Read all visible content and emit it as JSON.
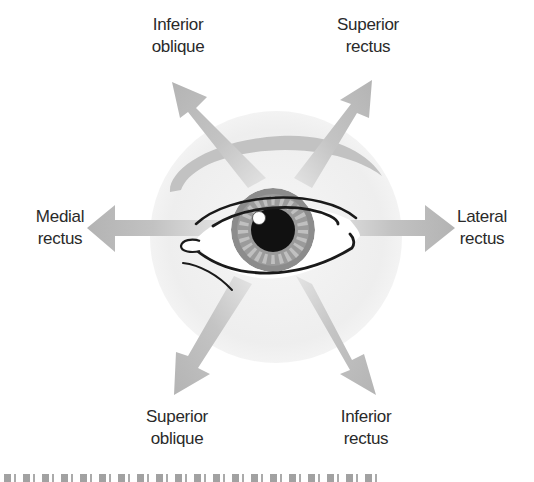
{
  "figure": {
    "type": "anatomical-diagram",
    "colors": {
      "background": "#ffffff",
      "face_circle": "#efefef",
      "eyebrow": "#bdbdbd",
      "arrow": "#b8b8b8",
      "iris_outer": "#8e8e8e",
      "iris_rays": "#b5b5b5",
      "pupil": "#111111",
      "outline": "#1a1a1a",
      "label_text": "#2a2a2a"
    }
  },
  "labels": {
    "inferior_oblique": {
      "line1": "Inferior",
      "line2": "oblique"
    },
    "superior_rectus": {
      "line1": "Superior",
      "line2": "rectus"
    },
    "medial_rectus": {
      "line1": "Medial",
      "line2": "rectus"
    },
    "lateral_rectus": {
      "line1": "Lateral",
      "line2": "rectus"
    },
    "superior_oblique": {
      "line1": "Superior",
      "line2": "oblique"
    },
    "inferior_rectus": {
      "line1": "Inferior",
      "line2": "rectus"
    }
  },
  "arrows": [
    {
      "muscle": "Inferior oblique",
      "direction": "up-left"
    },
    {
      "muscle": "Superior rectus",
      "direction": "up-right"
    },
    {
      "muscle": "Medial rectus",
      "direction": "left"
    },
    {
      "muscle": "Lateral rectus",
      "direction": "right"
    },
    {
      "muscle": "Superior oblique",
      "direction": "down-left"
    },
    {
      "muscle": "Inferior rectus",
      "direction": "down-right"
    }
  ],
  "caption": {
    "text": "",
    "note_cropped": true
  }
}
